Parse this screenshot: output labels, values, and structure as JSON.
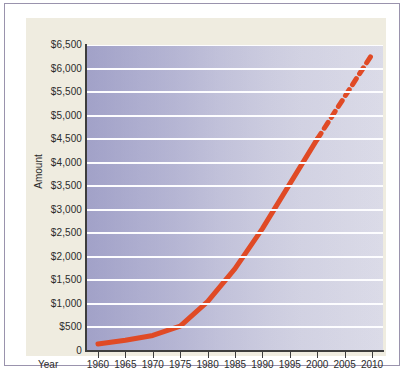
{
  "figure": {
    "paper_color": "#efece0",
    "frame_color": "#9a93ad",
    "plot_fill_left": "#b9b9d4",
    "plot_fill_right": "#dcdce8",
    "gridline_color": "#ffffff",
    "axis_color": "#3d3d3d"
  },
  "chart_data": {
    "type": "line",
    "title": "",
    "xlabel": "Year",
    "ylabel": "Amount",
    "xlim": [
      1958,
      2012
    ],
    "ylim": [
      0,
      6500
    ],
    "grid": true,
    "legend": "none",
    "series_color": "#e04a25",
    "x_tick_labels": [
      "1960",
      "1965",
      "1970",
      "1975",
      "1980",
      "1985",
      "1990",
      "1995",
      "2000",
      "2005",
      "2010"
    ],
    "x_ticks": [
      1960,
      1965,
      1970,
      1975,
      1980,
      1985,
      1990,
      1995,
      2000,
      2005,
      2010
    ],
    "y_tick_labels": [
      "0",
      "$500",
      "$1,000",
      "$1,500",
      "$2,000",
      "$2,500",
      "$3,000",
      "$3,500",
      "$4,000",
      "$4,500",
      "$5,000",
      "$5,500",
      "$6,000",
      "$6,500"
    ],
    "y_ticks": [
      0,
      500,
      1000,
      1500,
      2000,
      2500,
      3000,
      3500,
      4000,
      4500,
      5000,
      5500,
      6000,
      6500
    ],
    "series": [
      {
        "name": "Amount (actual)",
        "style": "solid",
        "x": [
          1960,
          1965,
          1970,
          1975,
          1980,
          1985,
          1990,
          1995,
          2000
        ],
        "values": [
          150,
          230,
          330,
          530,
          1050,
          1750,
          2600,
          3550,
          4500
        ]
      },
      {
        "name": "Amount (projected)",
        "style": "dashed",
        "x": [
          2000,
          2005,
          2010
        ],
        "values": [
          4500,
          5400,
          6300
        ]
      }
    ]
  }
}
